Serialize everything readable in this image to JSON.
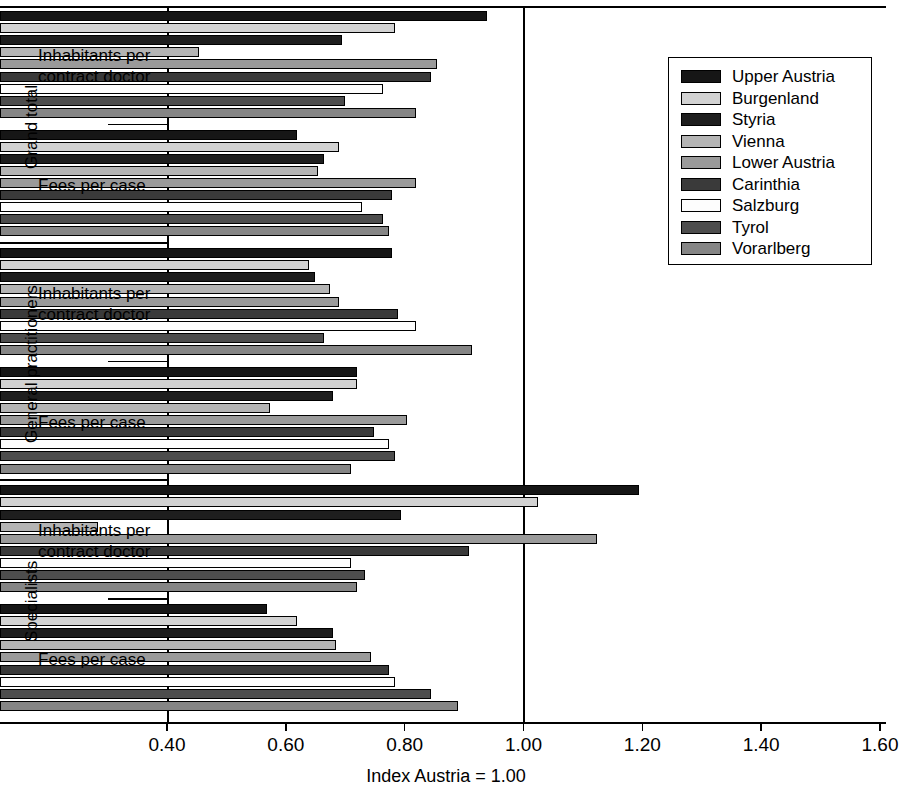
{
  "chart_data": {
    "type": "bar",
    "orientation": "horizontal",
    "title": "",
    "xlabel": "Index Austria = 1.00",
    "ylabel": "",
    "xlim": [
      0.4,
      1.6
    ],
    "xticks": [
      "0.40",
      "0.60",
      "0.80",
      "1.00",
      "1.20",
      "1.40",
      "1.60"
    ],
    "xtick_values": [
      0.4,
      0.6,
      0.8,
      1.0,
      1.2,
      1.4,
      1.6
    ],
    "grid": false,
    "reference_line": 1.0,
    "legend_position": "top-right",
    "series": [
      {
        "name": "Upper Austria",
        "color": "#161616"
      },
      {
        "name": "Burgenland",
        "color": "#d2d2d2"
      },
      {
        "name": "Styria",
        "color": "#1e1e1e"
      },
      {
        "name": "Vienna",
        "color": "#b4b4b4"
      },
      {
        "name": "Lower Austria",
        "color": "#9a9a9a"
      },
      {
        "name": "Carinthia",
        "color": "#3a3a3a"
      },
      {
        "name": "Salzburg",
        "color": "#fdfdfd"
      },
      {
        "name": "Tyrol",
        "color": "#4d4d4d"
      },
      {
        "name": "Vorarlberg",
        "color": "#858585"
      }
    ],
    "supergroups": [
      {
        "label": "Grand total",
        "groups": [
          0,
          1
        ]
      },
      {
        "label": "General practitioners",
        "groups": [
          2,
          3
        ]
      },
      {
        "label": "Specialists",
        "groups": [
          4,
          5
        ]
      }
    ],
    "groups": [
      {
        "label": "Inhabitants per contract doctor",
        "supergroup": "Grand total",
        "values": [
          1.22,
          1.065,
          0.975,
          0.735,
          1.135,
          1.125,
          1.045,
          0.98,
          1.1
        ]
      },
      {
        "label": "Fees per case",
        "supergroup": "Grand total",
        "values": [
          0.9,
          0.97,
          0.945,
          0.935,
          1.1,
          1.06,
          1.01,
          1.045,
          1.055
        ]
      },
      {
        "label": "Inhabitants per contract doctor",
        "supergroup": "General practitioners",
        "values": [
          1.06,
          0.92,
          0.93,
          0.955,
          0.97,
          1.07,
          1.1,
          0.945,
          1.195
        ]
      },
      {
        "label": "Fees per case",
        "supergroup": "General practitioners",
        "values": [
          1.0,
          1.0,
          0.96,
          0.855,
          1.085,
          1.03,
          1.055,
          1.065,
          0.99
        ]
      },
      {
        "label": "Inhabitants per contract doctor",
        "supergroup": "Specialists",
        "values": [
          1.475,
          1.305,
          1.075,
          0.565,
          1.405,
          1.19,
          0.99,
          1.015,
          1.0
        ]
      },
      {
        "label": "Fees per case",
        "supergroup": "Specialists",
        "values": [
          0.85,
          0.9,
          0.96,
          0.965,
          1.025,
          1.055,
          1.065,
          1.125,
          1.17
        ]
      }
    ]
  }
}
